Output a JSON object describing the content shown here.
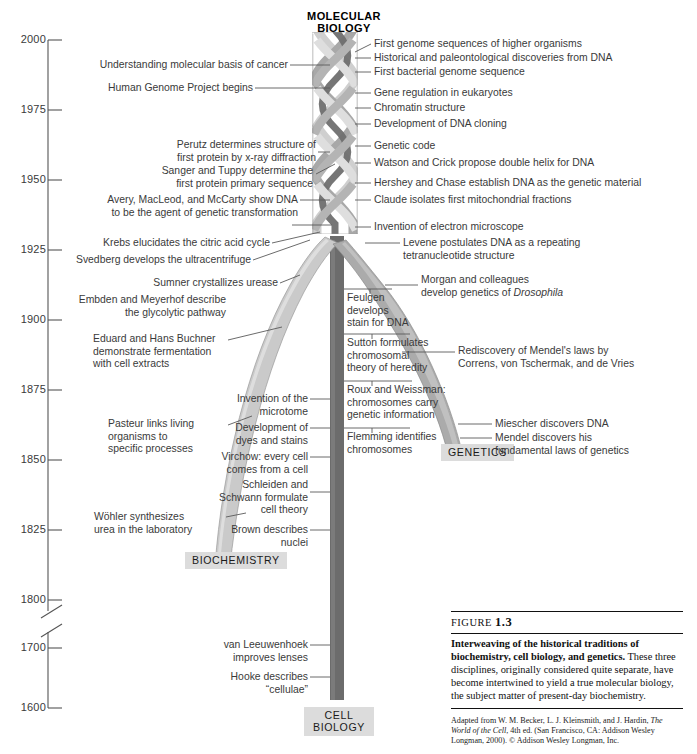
{
  "figure": {
    "number_label": "FIGURE",
    "number": "1.3",
    "title": "Interweaving of the historical traditions of biochemistry, cell biology, and genetics.",
    "body": "These three disciplines, originally considered quite separate, have become intertwined to yield a true molecular biology, the subject matter of present-day biochemistry.",
    "source_prefix": "Adapted from W. M. Becker, L. J. Kleinsmith, and J. Hardin, ",
    "source_italic": "The World of the Cell",
    "source_suffix": ", 4th ed. (San Francisco, CA: Addison Wesley Longman, 2000). © Addison Wesley Longman, Inc."
  },
  "axis": {
    "ticks": [
      "2000",
      "1975",
      "1950",
      "1925",
      "1900",
      "1875",
      "1850",
      "1825",
      "1800",
      "1700",
      "1600"
    ],
    "has_break": true,
    "break_between": [
      "1800",
      "1700"
    ]
  },
  "disciplines": {
    "molecular_biology": "MOLECULAR\nBIOLOGY",
    "biochemistry": "BIOCHEMISTRY",
    "genetics": "GENETICS",
    "cell_biology": "CELL\nBIOLOGY",
    "colors": {
      "biochemistry": "#c9c9c9",
      "genetics": "#aaaaaa",
      "cell_biology": "#6c6c6c",
      "braid_light": "#cfcfcf",
      "braid_mid": "#a8a8a8",
      "braid_dark": "#6f6f6f"
    }
  },
  "events_left": [
    "Understanding molecular basis of cancer",
    "Human Genome Project begins",
    "Perutz determines structure of\nfirst protein by x-ray diffraction",
    "Sanger and Tuppy determine the\nfirst protein primary sequence",
    "Avery, MacLeod, and McCarty show DNA\nto be the agent of genetic transformation",
    "Krebs elucidates the citric acid cycle",
    "Svedberg develops the ultracentrifuge",
    "Sumner crystallizes urease",
    "Embden and Meyerhof describe\nthe glycolytic pathway",
    "Eduard and Hans Buchner\ndemonstrate fermentation\nwith cell extracts",
    "Pasteur links living\norganisms to\nspecific processes",
    "Wöhler synthesizes\nurea in the laboratory"
  ],
  "events_right": [
    "First genome sequences of higher organisms",
    "Historical and paleontological discoveries from DNA",
    "First bacterial genome sequence",
    "Gene regulation in eukaryotes",
    "Chromatin structure",
    "Development of DNA cloning",
    "Genetic code",
    "Watson and Crick propose double helix for DNA",
    "Hershey and Chase establish DNA as the genetic material",
    "Claude isolates first mitochondrial fractions",
    "Invention of electron microscope",
    "Levene postulates DNA as a repeating\ntetranucleotide structure",
    "Rediscovery of Mendel's laws by\nCorrens, von Tschermak, and de Vries",
    "Miescher discovers DNA",
    "Mendel discovers his\nfundamental laws of genetics"
  ],
  "events_right_italic": {
    "morgan_plain": "Morgan and colleagues\ndevelop genetics of ",
    "morgan_italic": "Drosophila"
  },
  "events_cell_column": [
    "Feulgen\ndevelops\nstain for DNA",
    "Sutton formulates\nchromosomal\ntheory of heredity",
    "Roux and Weissman:\nchromosomes carry\ngenetic information",
    "Flemming identifies\nchromosomes"
  ],
  "events_cell_right": [
    "Invention of the\nmicrotome",
    "Development of\ndyes and stains",
    "Virchow: every cell\ncomes from a cell",
    "Schleiden and\nSchwann formulate\ncell theory",
    "Brown describes\nnuclei",
    "van Leeuwenhoek\nimproves lenses",
    "Hooke describes\n“cellulae”"
  ]
}
